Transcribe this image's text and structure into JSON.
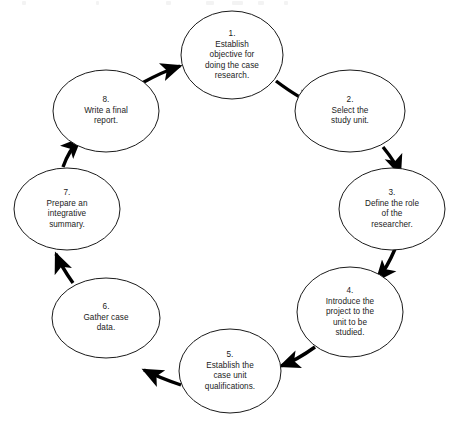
{
  "diagram": {
    "type": "circular-process-flow",
    "shape": "ellipse",
    "direction": "clockwise",
    "step_count": 8,
    "style": {
      "background_color": "#ffffff",
      "node_fill": "#ffffff",
      "node_stroke": "#1b1b1b",
      "node_stroke_width": 1,
      "arrow_color": "#000000",
      "text_color": "#1b1b1b"
    },
    "nodes": [
      {
        "number": "1.",
        "text": "Establish\nobjective for\ndoing the case\nresearch.",
        "label": "1.\nEstablish\nobjective for\ndoing the case\nresearch.",
        "cx": 232,
        "cy": 55,
        "rx": 51,
        "ry": 44
      },
      {
        "number": "2.",
        "text": "Select the\nstudy unit.",
        "label": "2.\nSelect the\nstudy unit.",
        "cx": 350,
        "cy": 111,
        "rx": 55,
        "ry": 41
      },
      {
        "number": "3.",
        "text": "Define the role\nof the\nresearcher.",
        "label": "3.\nDefine the role\nof the\nresearcher.",
        "cx": 392,
        "cy": 209,
        "rx": 53,
        "ry": 41
      },
      {
        "number": "4.",
        "text": "Introduce the\nproject to the\nunit to be\nstudied.",
        "label": "4.\nIntroduce the\nproject to the\nunit to be\nstudied.",
        "cx": 350,
        "cy": 312,
        "rx": 53,
        "ry": 45
      },
      {
        "number": "5.",
        "text": "Establish the\ncase unit\nqualifications.",
        "label": "5.\nEstablish the\ncase unit\nqualifications.",
        "cx": 230,
        "cy": 371,
        "rx": 51,
        "ry": 42
      },
      {
        "number": "6.",
        "text": "Gather case\ndata.",
        "label": "6.\nGather case\ndata.",
        "cx": 106,
        "cy": 318,
        "rx": 54,
        "ry": 40
      },
      {
        "number": "7.",
        "text": "Prepare an\nintegrative\nsummary.",
        "label": "7.\nPrepare an\nintegrative\nsummary.",
        "cx": 67,
        "cy": 209,
        "rx": 53,
        "ry": 41
      },
      {
        "number": "8.",
        "text": "Write a final\nreport.",
        "label": "8.\nWrite a final\nreport.",
        "cx": 106,
        "cy": 111,
        "rx": 53,
        "ry": 41
      }
    ],
    "connectors": [
      {
        "from": "1",
        "to": "2",
        "path": "M 276,81 Q 300,99 316,105"
      },
      {
        "from": "2",
        "to": "3",
        "path": "M 383,147 Q 396,163 400,174"
      },
      {
        "from": "3",
        "to": "4",
        "path": "M 395,249 Q 387,268 377,280"
      },
      {
        "from": "4",
        "to": "5",
        "path": "M 315,347 Q 297,360 281,366"
      },
      {
        "from": "5",
        "to": "6",
        "path": "M 181,385 Q 160,378 144,370"
      },
      {
        "from": "6",
        "to": "7",
        "path": "M 73,283 Q 61,266 56,254"
      },
      {
        "from": "7",
        "to": "8",
        "path": "M 63,167 Q 69,150 80,139"
      },
      {
        "from": "8",
        "to": "1",
        "path": "M 142,83 Q 162,72 180,66"
      }
    ]
  }
}
